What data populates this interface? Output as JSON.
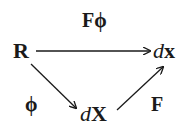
{
  "diagram": {
    "type": "commutative-diagram",
    "nodes": {
      "R": {
        "label": "R"
      },
      "dx": {
        "prefix": "d",
        "var": "x"
      },
      "dX": {
        "prefix": "d",
        "var": "X"
      }
    },
    "edges": {
      "top": {
        "from": "R",
        "to": "dx",
        "label": "Fϕ"
      },
      "left": {
        "from": "R",
        "to": "dX",
        "label": "ϕ"
      },
      "right": {
        "from": "dX",
        "to": "dx",
        "label": "F"
      }
    },
    "colors": {
      "ink": "#1a1a1a",
      "background": "#ffffff"
    }
  }
}
